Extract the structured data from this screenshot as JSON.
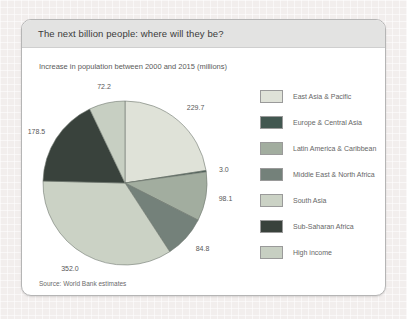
{
  "window": {
    "title": "The next billion people: where will they be?"
  },
  "subtitle": "Increase in population between 2000 and 2015 (millions)",
  "source": "Source: World Bank estimates",
  "chart_data": {
    "type": "pie",
    "title": "The next billion people: where will they be?",
    "subtitle": "Increase in population between 2000 and 2015 (millions)",
    "unit": "millions",
    "total": 1018.3,
    "start_angle": "12 o'clock, clockwise",
    "legend_position": "right",
    "value_label_decimals": 1,
    "slices": [
      {
        "label": "East Asia & Pacific",
        "value": 229.7,
        "color": "#dfe2d8"
      },
      {
        "label": "Europe & Central Asia",
        "value": 3.0,
        "color": "#425750"
      },
      {
        "label": "Latin America & Caribbean",
        "value": 98.1,
        "color": "#a2ad9f"
      },
      {
        "label": "Middle East & North Africa",
        "value": 84.8,
        "color": "#74817a"
      },
      {
        "label": "South Asia",
        "value": 352.0,
        "color": "#cbd2c5"
      },
      {
        "label": "Sub-Saharan Africa",
        "value": 178.5,
        "color": "#39423c"
      },
      {
        "label": "High income",
        "value": 72.2,
        "color": "#c7cfc2"
      }
    ]
  }
}
